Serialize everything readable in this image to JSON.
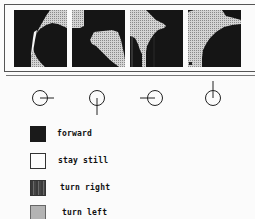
{
  "figure": {
    "panels": [
      {
        "id": "panel-1",
        "orientation": "east"
      },
      {
        "id": "panel-2",
        "orientation": "south"
      },
      {
        "id": "panel-3",
        "orientation": "west"
      },
      {
        "id": "panel-4",
        "orientation": "north"
      }
    ],
    "direction_icons": [
      "east",
      "south",
      "west",
      "north"
    ]
  },
  "legend": {
    "items": [
      {
        "key": "forward",
        "label": "forward"
      },
      {
        "key": "still",
        "label": "stay still"
      },
      {
        "key": "right",
        "label": "turn right"
      },
      {
        "key": "left",
        "label": "turn left"
      }
    ]
  },
  "colors": {
    "forward": "#1a1a1a",
    "stay_still": "#fdfdfd",
    "turn_right": "#4a4a4a",
    "turn_left": "#c8c8c8"
  }
}
